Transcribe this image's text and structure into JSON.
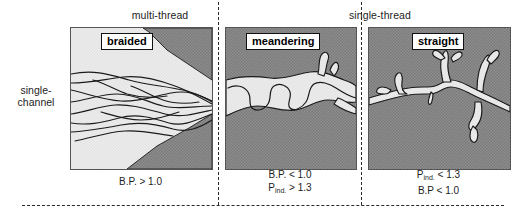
{
  "figure": {
    "row_label_line1": "single-",
    "row_label_line2": "channel",
    "colors": {
      "floodplain_dark": "#8a8a8a",
      "channel_light": "#ededed",
      "outline": "#1a1a1a",
      "separator": "#2a2a2a",
      "background": "#ffffff"
    }
  },
  "groups": [
    {
      "id": "multi-thread",
      "label": "multi-thread"
    },
    {
      "id": "single-thread",
      "label": "single-thread"
    }
  ],
  "panels": [
    {
      "id": "braided",
      "plaque": "braided",
      "caption_lines": [
        {
          "prefix": "B.P. > 1.0",
          "sub": "",
          "suffix": ""
        }
      ],
      "caption_plain": "B.P. > 1.0"
    },
    {
      "id": "meandering",
      "plaque": "meandering",
      "caption_lines": [
        {
          "prefix": "B.P. < 1.0",
          "sub": "",
          "suffix": ""
        },
        {
          "prefix": "P",
          "sub": "ind.",
          "suffix": " > 1.3"
        }
      ],
      "caption_plain": "B.P. < 1.0 / P ind. > 1.3"
    },
    {
      "id": "straight",
      "plaque": "straight",
      "caption_lines": [
        {
          "prefix": "P",
          "sub": "ind.",
          "suffix": " < 1.3"
        },
        {
          "prefix": "B.P < 1.0",
          "sub": "",
          "suffix": ""
        }
      ],
      "caption_plain": "P ind. < 1.3 / B.P < 1.0"
    }
  ],
  "captions": {
    "braided_l1_text": "B.P. > 1.0",
    "meandering_l1_text": "B.P. < 1.0",
    "meandering_l2_prefix": "P",
    "meandering_l2_sub": "ind.",
    "meandering_l2_suffix": " > 1.3",
    "straight_l1_prefix": "P",
    "straight_l1_sub": "ind.",
    "straight_l1_suffix": " < 1.3",
    "straight_l2_text": "B.P < 1.0"
  }
}
